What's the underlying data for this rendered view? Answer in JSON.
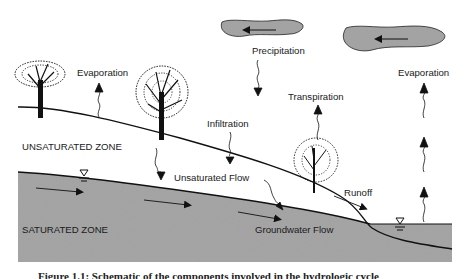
{
  "labels": {
    "evaporation_left": "Evaporation",
    "precipitation": "Precipitation",
    "transpiration": "Transpiration",
    "evaporation_right": "Evaporation",
    "infiltration": "Infiltration",
    "unsaturated_zone": "UNSATURATED ZONE",
    "unsaturated_flow": "Unsaturated Flow",
    "runoff": "Runoff",
    "saturated_zone": "SATURATED ZONE",
    "groundwater_flow": "Groundwater Flow"
  },
  "caption": "Figure 1.1: Schematic of the components involved in the hydrologic cycle",
  "colors": {
    "saturated_fill": "#a6a6a6",
    "cloud_fill": "#a3a3a3",
    "line": "#111111",
    "background": "#ffffff"
  },
  "icons": {
    "water_table": "inverted-triangle-water-table-symbol",
    "tree": "tree-silhouette",
    "cloud": "cloud-with-wind-arrow"
  }
}
